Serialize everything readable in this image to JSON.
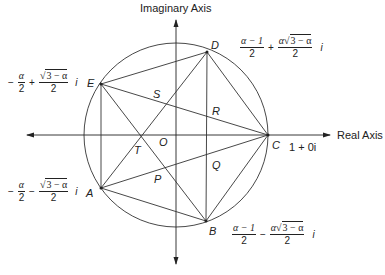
{
  "axes": {
    "imaginary_label": "Imaginary Axis",
    "real_label": "Real Axis"
  },
  "points": {
    "A": "A",
    "B": "B",
    "C": "C",
    "D": "D",
    "E": "E",
    "O": "O",
    "P": "P",
    "Q": "Q",
    "R": "R",
    "S": "S",
    "T": "T"
  },
  "expressions": {
    "C": "1 + 0i",
    "D": {
      "num1": "α − 1",
      "den1": "2",
      "op": "+",
      "num2_pre": "α√",
      "num2_rad": "3 − α",
      "den2": "2",
      "suffix": "i"
    },
    "B": {
      "num1": "α − 1",
      "den1": "2",
      "op": "−",
      "num2_pre": "α√",
      "num2_rad": "3 − α",
      "den2": "2",
      "suffix": "i"
    },
    "E": {
      "sign": "−",
      "num1": "α",
      "den1": "2",
      "op": "+",
      "num2_pre": "√",
      "num2_rad": "3 − α",
      "den2": "2",
      "suffix": "i"
    },
    "A": {
      "sign": "−",
      "num1": "α",
      "den1": "2",
      "op": "−",
      "num2_pre": "√",
      "num2_rad": "3 − α",
      "den2": "2",
      "suffix": "i"
    }
  },
  "geometry": {
    "center": [
      176,
      135
    ],
    "radius": 92,
    "vertices": {
      "A": [
        101,
        188
      ],
      "B": [
        206,
        221
      ],
      "C": [
        268,
        135
      ],
      "D": [
        207,
        52
      ],
      "E": [
        101,
        84
      ]
    }
  }
}
